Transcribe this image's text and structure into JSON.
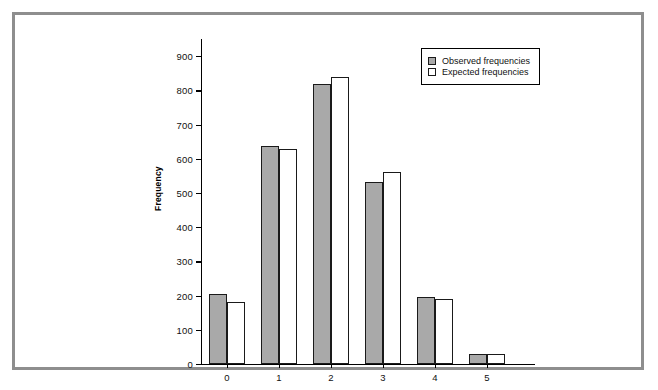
{
  "chart_data": {
    "type": "bar",
    "title": "",
    "xlabel": "",
    "ylabel": "Frequency",
    "categories": [
      "0",
      "1",
      "2",
      "3",
      "4",
      "5"
    ],
    "series": [
      {
        "name": "Observed frequencies",
        "color": "#a9a9a9",
        "values": [
          205,
          636,
          819,
          532,
          196,
          30
        ]
      },
      {
        "name": "Expected frequencies",
        "color": "#ffffff",
        "values": [
          182,
          629,
          838,
          560,
          189,
          28
        ]
      }
    ],
    "ylim": [
      0,
      950
    ],
    "yticks": [
      0,
      100,
      200,
      300,
      400,
      500,
      600,
      700,
      800,
      900
    ],
    "ytick_labels": [
      "0",
      "100",
      "200",
      "300",
      "400",
      "500",
      "600",
      "700",
      "800",
      "900"
    ],
    "grid": false,
    "legend_position": "top-right"
  },
  "legend": {
    "entries": [
      {
        "label": "Observed frequencies",
        "swatch": "observed"
      },
      {
        "label": "Expected frequencies",
        "swatch": "expected"
      }
    ]
  },
  "colors": {
    "frame": "#8e8e8e",
    "axis": "#000000",
    "observed_fill": "#a9a9a9",
    "expected_fill": "#ffffff"
  }
}
